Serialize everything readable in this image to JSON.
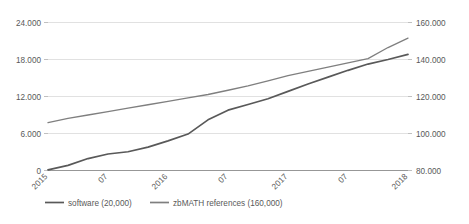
{
  "chart_data": {
    "type": "line",
    "title": "",
    "subtitle": "",
    "xlabel": "",
    "ylabel": "",
    "grid": true,
    "legend_position": "bottom",
    "x_tick_labels": [
      "2015",
      "07",
      "2016",
      "07",
      "2017",
      "07",
      "2018"
    ],
    "x_tick_rotation": -45,
    "axes": [
      {
        "id": "left",
        "side": "left",
        "tick_labels": [
          "24.000",
          "18.000",
          "12.000",
          "6.000",
          "0"
        ],
        "tick_values": [
          24000,
          18000,
          12000,
          6000,
          0
        ],
        "ylim": [
          0,
          26000
        ]
      },
      {
        "id": "right",
        "side": "right",
        "tick_labels": [
          "160.000",
          "140.000",
          "120.000",
          "100.000",
          "80.000"
        ],
        "tick_values": [
          160000,
          140000,
          120000,
          100000,
          80000
        ],
        "ylim": [
          80000,
          166667
        ]
      }
    ],
    "series": [
      {
        "name": "software (20,000)",
        "axis": "left",
        "color": "#595959",
        "stroke_width": 1.7,
        "x": [
          "2015-01",
          "2015-03",
          "2015-05",
          "2015-07",
          "2015-09",
          "2015-11",
          "2016-01",
          "2016-03",
          "2016-05",
          "2016-07",
          "2016-09",
          "2016-11",
          "2017-01",
          "2017-03",
          "2017-05",
          "2017-07",
          "2017-09",
          "2017-11",
          "2018-01"
        ],
        "values": [
          120,
          900,
          2100,
          2900,
          3300,
          4100,
          5200,
          6400,
          8900,
          10600,
          11600,
          12600,
          13900,
          15200,
          16400,
          17600,
          18700,
          19500,
          20400
        ]
      },
      {
        "name": "zbMATH references (160,000)",
        "axis": "right",
        "color": "#7f7f7f",
        "stroke_width": 1.3,
        "x": [
          "2015-01",
          "2015-03",
          "2015-05",
          "2015-07",
          "2015-09",
          "2015-11",
          "2016-01",
          "2016-03",
          "2016-05",
          "2016-07",
          "2016-09",
          "2016-11",
          "2017-01",
          "2017-03",
          "2017-05",
          "2017-07",
          "2017-09",
          "2017-11",
          "2018-01"
        ],
        "values": [
          108000,
          110500,
          112500,
          114500,
          116500,
          118500,
          120500,
          122500,
          124500,
          127000,
          129500,
          132500,
          135500,
          138000,
          140500,
          143000,
          145500,
          152000,
          157500
        ]
      }
    ],
    "legend": [
      {
        "label": "software (20,000)",
        "color": "#595959"
      },
      {
        "label": "zbMATH references (160,000)",
        "color": "#7f7f7f"
      }
    ]
  }
}
